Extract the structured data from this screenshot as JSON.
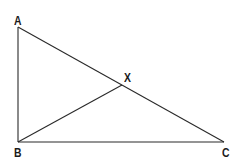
{
  "diagram": {
    "type": "geometry-triangle",
    "stroke_color": "#2a2a2a",
    "points": {
      "A": {
        "x": 18,
        "y": 27
      },
      "B": {
        "x": 18,
        "y": 142
      },
      "C": {
        "x": 224,
        "y": 142
      },
      "X": {
        "x": 122,
        "y": 85
      }
    },
    "segments": [
      {
        "from": "A",
        "to": "B"
      },
      {
        "from": "B",
        "to": "C"
      },
      {
        "from": "A",
        "to": "C"
      },
      {
        "from": "B",
        "to": "X"
      }
    ],
    "labels": {
      "A": "A",
      "B": "B",
      "C": "C",
      "X": "X"
    }
  }
}
